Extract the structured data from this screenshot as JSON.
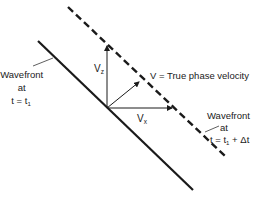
{
  "diagram": {
    "title": "",
    "wavefront_t1": {
      "line1": "Wavefront",
      "line2": "at",
      "line3": "t = t",
      "sub": "1"
    },
    "wavefront_t2": {
      "line1": "Wavefront",
      "line2": "at",
      "line3a": "t = t",
      "sub": "1",
      "line3b": " + Δt"
    },
    "vectors": {
      "vz_main": "V",
      "vz_sub": "z",
      "vx_main": "V",
      "vx_sub": "x",
      "v_label": "V = True phase velocity"
    },
    "colors": {
      "line": "#1a1a1a",
      "background": "#ffffff"
    }
  }
}
